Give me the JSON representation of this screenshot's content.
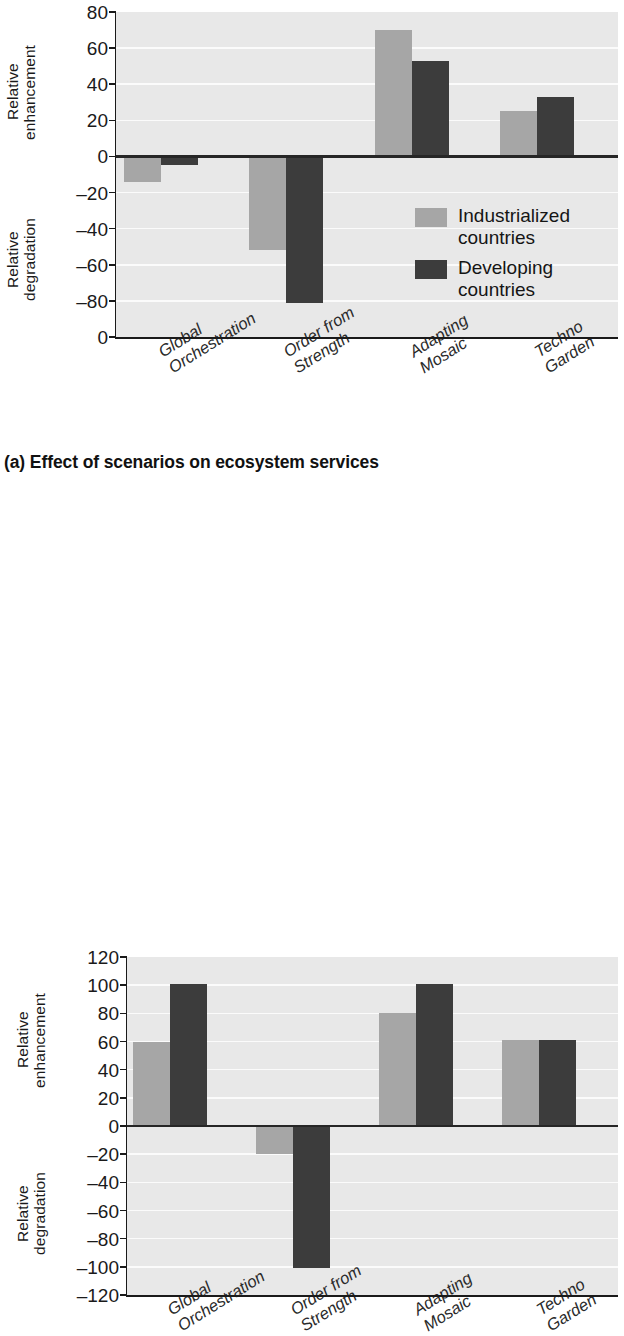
{
  "figure": {
    "caption_a": "(a) Effect of scenarios on ecosystem services",
    "legend": {
      "items": [
        {
          "label": "Industrialized\ncountries",
          "color": "#a6a6a6"
        },
        {
          "label": "Developing\ncountries",
          "color": "#3c3c3c"
        }
      ]
    },
    "colors": {
      "industrialized": "#a6a6a6",
      "developing": "#3c3c3c",
      "plot_background": "#e8e8e8",
      "gridline": "#fbfbfb",
      "axis": "#1a1a1a"
    }
  },
  "chart_data": [
    {
      "type": "bar",
      "title": "(a) Effect of scenarios on ecosystem services",
      "panel": "a",
      "xlabel": "",
      "ylabel_top": "Relative\nenhancement",
      "ylabel_bottom": "Relative\ndegradation",
      "categories": [
        "Global\nOrchestration",
        "Order from\nStrength",
        "Adapting\nMosaic",
        "Techno\nGarden"
      ],
      "series": [
        {
          "name": "Industrialized countries",
          "color": "#a6a6a6",
          "values": [
            -14,
            -52,
            70,
            25
          ]
        },
        {
          "name": "Developing countries",
          "color": "#3c3c3c",
          "values": [
            -5,
            -81,
            53,
            33
          ]
        }
      ],
      "ylim": [
        -100,
        80
      ],
      "ytick_values": [
        80,
        60,
        40,
        20,
        0,
        -20,
        -40,
        -60,
        -80,
        -100
      ],
      "ytick_labels": [
        "80",
        "60",
        "40",
        "20",
        "0",
        "–20",
        "–40",
        "–60",
        "–80",
        "0"
      ],
      "grid": true,
      "legend_position": "inside-right"
    },
    {
      "type": "bar",
      "title": "",
      "panel": "b",
      "xlabel": "",
      "ylabel_top": "Relative\nenhancement",
      "ylabel_bottom": "Relative\ndegradation",
      "categories": [
        "Global\nOrchestration",
        "Order from\nStrength",
        "Adapting\nMosaic",
        "Techno\nGarden"
      ],
      "series": [
        {
          "name": "Industrialized countries",
          "color": "#a6a6a6",
          "values": [
            60,
            -20,
            80,
            61
          ]
        },
        {
          "name": "Developing countries",
          "color": "#3c3c3c",
          "values": [
            101,
            -101,
            101,
            61
          ]
        }
      ],
      "ylim": [
        -120,
        120
      ],
      "ytick_values": [
        120,
        100,
        80,
        60,
        40,
        20,
        0,
        -20,
        -40,
        -60,
        -80,
        -100,
        -120
      ],
      "ytick_labels": [
        "120",
        "100",
        "80",
        "60",
        "40",
        "20",
        "0",
        "–20",
        "–40",
        "–60",
        "–80",
        "–100",
        "–120"
      ],
      "grid": true,
      "legend_position": "none"
    }
  ]
}
